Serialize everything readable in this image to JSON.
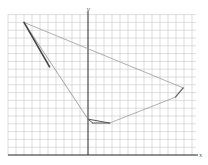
{
  "diagram": {
    "type": "coordinate-plane-polygon",
    "axes": {
      "x_label": "x",
      "y_label": "y"
    },
    "grid": {
      "x_min": -10,
      "x_max": 13.5,
      "y_min": 0,
      "y_max": 18,
      "origin_px": [
        88,
        155
      ],
      "unit_x_px": 8,
      "unit_y_px": 7.8,
      "color": "#c8c8c8"
    },
    "polygon": {
      "vertices": [
        {
          "name": "A",
          "x": -8,
          "y": 17
        },
        {
          "name": "B",
          "x": 11.9,
          "y": 8.6
        },
        {
          "name": "C",
          "x": 10.9,
          "y": 7.4
        },
        {
          "name": "D",
          "x": 2.7,
          "y": 4.1
        },
        {
          "name": "E",
          "x": 0.6,
          "y": 4.1
        },
        {
          "name": "F",
          "x": 0,
          "y": 4.6
        }
      ],
      "edges": [
        {
          "from": "A",
          "to": "B",
          "color": "#9a9a9a",
          "width": 0.8
        },
        {
          "from": "B",
          "to": "C",
          "color": "#555555",
          "width": 1.1
        },
        {
          "from": "C",
          "to": "D",
          "color": "#9a9a9a",
          "width": 0.8
        },
        {
          "from": "D",
          "to": "F",
          "color": "#555555",
          "width": 1.0
        },
        {
          "from": "F",
          "to": "E",
          "color": "#555555",
          "width": 1.0
        },
        {
          "from": "E",
          "to": "D",
          "color": "#555555",
          "width": 1.0
        },
        {
          "from": "F",
          "to": "A",
          "color": "#8a8a8a",
          "width": 0.8
        }
      ],
      "emphasized_segment": {
        "from": [
          -8,
          17
        ],
        "to": [
          -4.8,
          11.3
        ],
        "color": "#444444",
        "width": 1.6
      }
    }
  }
}
